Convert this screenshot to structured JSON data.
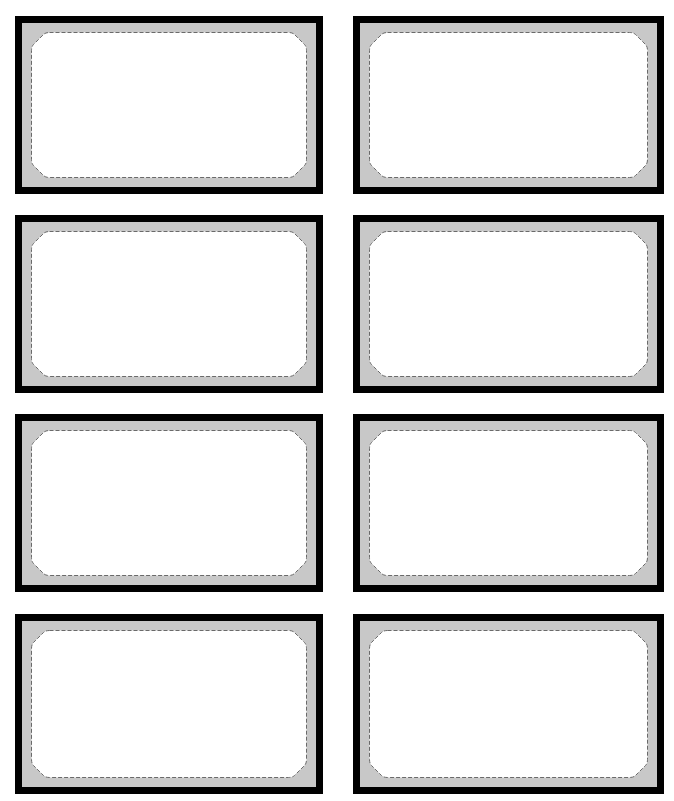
{
  "sheet": {
    "width": 674,
    "height": 801,
    "background": "#ffffff"
  },
  "style": {
    "outer_border_color": "#000000",
    "outer_border_width": 7,
    "frame_fill_color": "#c8c8c8",
    "inner_fill_color": "#ffffff",
    "dash_color": "#6a6a6a",
    "dash_width": 1,
    "dash_pattern": "4 2",
    "frame_band": 9,
    "chamfer": 18
  },
  "labels": [
    {
      "id": 1,
      "x": 15,
      "y": 16,
      "w": 308,
      "h": 178,
      "text": ""
    },
    {
      "id": 2,
      "x": 353,
      "y": 16,
      "w": 311,
      "h": 178,
      "text": ""
    },
    {
      "id": 3,
      "x": 15,
      "y": 215,
      "w": 308,
      "h": 178,
      "text": ""
    },
    {
      "id": 4,
      "x": 353,
      "y": 215,
      "w": 311,
      "h": 178,
      "text": ""
    },
    {
      "id": 5,
      "x": 15,
      "y": 414,
      "w": 308,
      "h": 178,
      "text": ""
    },
    {
      "id": 6,
      "x": 353,
      "y": 414,
      "w": 311,
      "h": 178,
      "text": ""
    },
    {
      "id": 7,
      "x": 15,
      "y": 614,
      "w": 308,
      "h": 180,
      "text": ""
    },
    {
      "id": 8,
      "x": 353,
      "y": 614,
      "w": 311,
      "h": 180,
      "text": ""
    }
  ]
}
